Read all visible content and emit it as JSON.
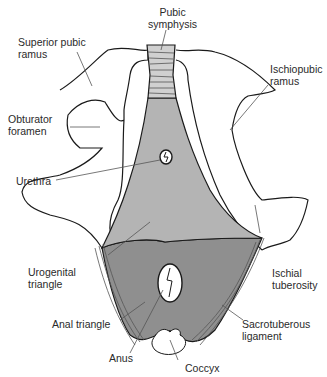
{
  "figure": {
    "colors": {
      "urogenital_triangle": "#b4b4b4",
      "anal_triangle": "#8f8f8f",
      "symphysis": "#c8c8c8",
      "outline": "#1a1a1a",
      "leader": "#555555",
      "background": "#ffffff"
    }
  },
  "labels": {
    "pubic_symphysis": "Pubic\nsymphysis",
    "superior_pubic_ramus": "Superior pubic\nramus",
    "ischiopubic_ramus": "Ischiopubic\nramus",
    "obturator_foramen": "Obturator\nforamen",
    "urethra": "Urethra",
    "urogenital_triangle": "Urogenital\ntriangle",
    "ischial_tuberosity": "Ischial\ntuberosity",
    "anal_triangle": "Anal triangle",
    "sacrotuberous_ligament": "Sacrotuberous\nligament",
    "anus": "Anus",
    "coccyx": "Coccyx"
  }
}
